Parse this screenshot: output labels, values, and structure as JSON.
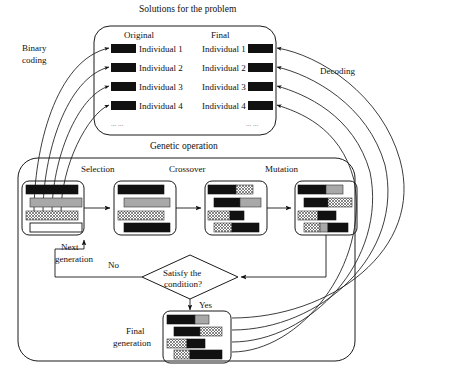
{
  "diagram": {
    "title_solutions": "Solutions for the problem",
    "title_genetic": "Genetic operation",
    "label_binary_coding_line1": "Binary",
    "label_binary_coding_line2": "coding",
    "label_decoding": "Decoding",
    "label_original": "Original",
    "label_final": "Final",
    "label_next_line1": "Next",
    "label_next_line2": "generation",
    "label_no": "No",
    "label_yes": "Yes",
    "label_final_gen_line1": "Final",
    "label_final_gen_line2": "generation",
    "decision_line1": "Satisfy the",
    "decision_line2": "condition?",
    "ellipsis_left": "... ...",
    "ellipsis_right": "... ...",
    "stage_selection": "Selection",
    "stage_crossover": "Crossover",
    "stage_mutation": "Mutation",
    "individuals_original": [
      "Individual 1",
      "Individual 2",
      "Individual 3",
      "Individual 4"
    ],
    "individuals_final": [
      "Individual 1",
      "Individual 2",
      "Individual 3",
      "Individual 4"
    ]
  },
  "colors": {
    "stroke": "#1a1a1a",
    "black_fill": "#111111",
    "gray_fill": "#a8a8a8",
    "white_fill": "#ffffff",
    "hatch_fill": "#d9d9d9",
    "background": "#ffffff"
  },
  "chromosome_boxes": {
    "population": {
      "name": "initial-population",
      "rows": [
        [
          {
            "fill": "black",
            "w": 1.0
          }
        ],
        [
          {
            "fill": "gray",
            "w": 1.0
          }
        ],
        [
          {
            "fill": "hatch",
            "w": 1.0
          }
        ],
        [
          {
            "fill": "white",
            "w": 1.0
          }
        ]
      ]
    },
    "selection": {
      "name": "selection-population",
      "rows": [
        [
          {
            "fill": "black",
            "w": 1.0
          }
        ],
        [
          {
            "fill": "gray",
            "w": 1.0
          }
        ],
        [
          {
            "fill": "hatch",
            "w": 1.0
          }
        ],
        [
          {
            "fill": "black",
            "w": 1.0
          }
        ]
      ]
    },
    "crossover": {
      "name": "crossover-population",
      "rows": [
        [
          {
            "fill": "black",
            "w": 0.62
          },
          {
            "fill": "hatch",
            "w": 0.38
          }
        ],
        [
          {
            "fill": "black",
            "w": 0.55
          },
          {
            "fill": "gray",
            "w": 0.45
          }
        ],
        [
          {
            "fill": "hatch",
            "w": 0.48
          },
          {
            "fill": "black",
            "w": 0.52
          }
        ],
        [
          {
            "fill": "hatch",
            "w": 0.4
          },
          {
            "fill": "black",
            "w": 0.6
          }
        ]
      ]
    },
    "mutation": {
      "name": "mutation-population",
      "rows": [
        [
          {
            "fill": "black",
            "w": 0.62
          },
          {
            "fill": "gray",
            "w": 0.38
          }
        ],
        [
          {
            "fill": "black",
            "w": 0.5
          },
          {
            "fill": "hatch",
            "w": 0.5
          }
        ],
        [
          {
            "fill": "hatch",
            "w": 0.45
          },
          {
            "fill": "black",
            "w": 0.55
          }
        ],
        [
          {
            "fill": "hatch",
            "w": 0.36
          },
          {
            "fill": "gray",
            "w": 0.18
          },
          {
            "fill": "black",
            "w": 0.46
          }
        ]
      ]
    },
    "final_generation": {
      "name": "final-generation-population",
      "rows": [
        [
          {
            "fill": "black",
            "w": 0.65
          },
          {
            "fill": "gray",
            "w": 0.35
          }
        ],
        [
          {
            "fill": "black",
            "w": 0.52
          },
          {
            "fill": "hatch",
            "w": 0.48
          }
        ],
        [
          {
            "fill": "hatch",
            "w": 0.46
          },
          {
            "fill": "black",
            "w": 0.54
          }
        ],
        [
          {
            "fill": "hatch",
            "w": 0.36
          },
          {
            "fill": "black",
            "w": 0.64
          }
        ]
      ]
    },
    "solution_original": {
      "name": "original-solution-blocks",
      "rows": [
        [
          {
            "fill": "black",
            "w": 1.0
          }
        ],
        [
          {
            "fill": "black",
            "w": 1.0
          }
        ],
        [
          {
            "fill": "black",
            "w": 1.0
          }
        ],
        [
          {
            "fill": "black",
            "w": 1.0
          }
        ]
      ]
    },
    "solution_final": {
      "name": "final-solution-blocks",
      "rows": [
        [
          {
            "fill": "black",
            "w": 1.0
          }
        ],
        [
          {
            "fill": "black",
            "w": 1.0
          }
        ],
        [
          {
            "fill": "black",
            "w": 1.0
          }
        ],
        [
          {
            "fill": "black",
            "w": 1.0
          }
        ]
      ]
    }
  }
}
